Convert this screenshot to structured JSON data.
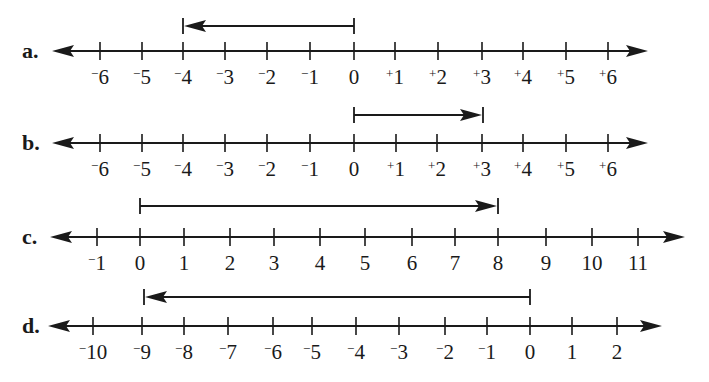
{
  "figure": {
    "background": "#ffffff",
    "ink": "#1a1a1a",
    "lines": [
      {
        "part": "a.",
        "axis_y": 51,
        "arrow_left_x": 52,
        "arrow_right_x": 648,
        "ticks": [
          {
            "value": -6,
            "label": "−6",
            "x": 100
          },
          {
            "value": -5,
            "label": "−5",
            "x": 142
          },
          {
            "value": -4,
            "label": "−4",
            "x": 183
          },
          {
            "value": -3,
            "label": "−3",
            "x": 225
          },
          {
            "value": -2,
            "label": "−2",
            "x": 267
          },
          {
            "value": -1,
            "label": "−1",
            "x": 310
          },
          {
            "value": 0,
            "label": "0",
            "x": 354
          },
          {
            "value": 1,
            "label": "+1",
            "x": 395
          },
          {
            "value": 2,
            "label": "+2",
            "x": 438
          },
          {
            "value": 3,
            "label": "+3",
            "x": 482
          },
          {
            "value": 4,
            "label": "+4",
            "x": 523
          },
          {
            "value": 5,
            "label": "+5",
            "x": 566
          },
          {
            "value": 6,
            "label": "+6",
            "x": 608
          }
        ],
        "vector": {
          "from": 0,
          "to": -4,
          "from_x": 354,
          "to_x": 183,
          "y": 26
        }
      },
      {
        "part": "b.",
        "axis_y": 143,
        "arrow_left_x": 52,
        "arrow_right_x": 648,
        "ticks": [
          {
            "value": -6,
            "label": "−6",
            "x": 100
          },
          {
            "value": -5,
            "label": "−5",
            "x": 142
          },
          {
            "value": -4,
            "label": "−4",
            "x": 183
          },
          {
            "value": -3,
            "label": "−3",
            "x": 225
          },
          {
            "value": -2,
            "label": "−2",
            "x": 267
          },
          {
            "value": -1,
            "label": "−1",
            "x": 310
          },
          {
            "value": 0,
            "label": "0",
            "x": 354
          },
          {
            "value": 1,
            "label": "+1",
            "x": 396
          },
          {
            "value": 2,
            "label": "+2",
            "x": 437
          },
          {
            "value": 3,
            "label": "+3",
            "x": 482
          },
          {
            "value": 4,
            "label": "+4",
            "x": 523
          },
          {
            "value": 5,
            "label": "+5",
            "x": 566
          },
          {
            "value": 6,
            "label": "+6",
            "x": 608
          }
        ],
        "vector": {
          "from": 0,
          "to": 3,
          "from_x": 354,
          "to_x": 483,
          "y": 115
        }
      },
      {
        "part": "c.",
        "axis_y": 237,
        "arrow_left_x": 50,
        "arrow_right_x": 685,
        "ticks": [
          {
            "value": -1,
            "label": "−1",
            "x": 97
          },
          {
            "value": 0,
            "label": "0",
            "x": 140
          },
          {
            "value": 1,
            "label": "1",
            "x": 184
          },
          {
            "value": 2,
            "label": "2",
            "x": 230
          },
          {
            "value": 3,
            "label": "3",
            "x": 274
          },
          {
            "value": 4,
            "label": "4",
            "x": 320
          },
          {
            "value": 5,
            "label": "5",
            "x": 365
          },
          {
            "value": 6,
            "label": "6",
            "x": 412
          },
          {
            "value": 7,
            "label": "7",
            "x": 455
          },
          {
            "value": 8,
            "label": "8",
            "x": 498
          },
          {
            "value": 9,
            "label": "9",
            "x": 546
          },
          {
            "value": 10,
            "label": "10",
            "x": 592
          },
          {
            "value": 11,
            "label": "11",
            "x": 638
          }
        ],
        "vector": {
          "from": 0,
          "to": 8,
          "from_x": 140,
          "to_x": 498,
          "y": 206
        }
      },
      {
        "part": "d.",
        "axis_y": 326,
        "arrow_left_x": 48,
        "arrow_right_x": 662,
        "ticks": [
          {
            "value": -10,
            "label": "−10",
            "x": 93
          },
          {
            "value": -9,
            "label": "−9",
            "x": 142
          },
          {
            "value": -8,
            "label": "−8",
            "x": 184
          },
          {
            "value": -7,
            "label": "−7",
            "x": 228
          },
          {
            "value": -6,
            "label": "−6",
            "x": 273
          },
          {
            "value": -5,
            "label": "−5",
            "x": 312
          },
          {
            "value": -4,
            "label": "−4",
            "x": 356
          },
          {
            "value": -3,
            "label": "−3",
            "x": 399
          },
          {
            "value": -2,
            "label": "−2",
            "x": 445
          },
          {
            "value": -1,
            "label": "−1",
            "x": 487
          },
          {
            "value": 0,
            "label": "0",
            "x": 530
          },
          {
            "value": 1,
            "label": "1",
            "x": 572
          },
          {
            "value": 2,
            "label": "2",
            "x": 617
          }
        ],
        "vector": {
          "from": 0,
          "to": -9,
          "from_x": 530,
          "to_x": 144,
          "y": 297
        }
      }
    ]
  }
}
